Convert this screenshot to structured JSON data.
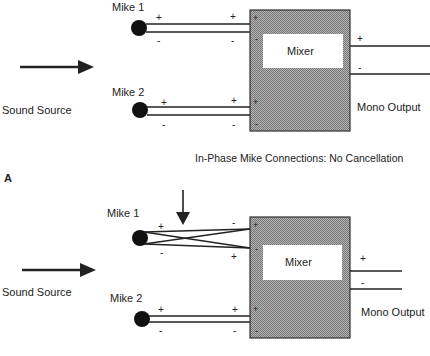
{
  "diagram_a": {
    "panel_label": "A",
    "caption": "In-Phase Mike Connections: No Cancellation",
    "source_label": "Sound Source",
    "mike1": {
      "label": "Mike 1",
      "pos_label": "+",
      "neg_label": "-",
      "wiring": "straight"
    },
    "mike2": {
      "label": "Mike 2",
      "pos_label": "+",
      "neg_label": "-",
      "wiring": "straight"
    },
    "mixer": {
      "label": "Mixer",
      "in1_pos": "+",
      "in1_neg": "-",
      "in2_pos": "+",
      "in2_neg": "-"
    },
    "output": {
      "label": "Mono Output",
      "pos_label": "+",
      "neg_label": "-"
    }
  },
  "diagram_b": {
    "source_label": "Sound Source",
    "mike1": {
      "label": "Mike 1",
      "near_pos_label": "+",
      "near_neg_label": "-",
      "far_top_label": "-",
      "far_bottom_label": "+",
      "wiring": "crossed"
    },
    "mike2": {
      "label": "Mike 2",
      "pos_label": "+",
      "neg_label": "-",
      "wiring": "straight"
    },
    "mixer": {
      "label": "Mixer",
      "in1_pos": "+",
      "in1_neg": "-",
      "in2_pos": "+",
      "in2_neg": "-"
    },
    "output": {
      "label": "Mono Output",
      "pos_label": "+",
      "neg_label": "-"
    }
  },
  "colors": {
    "line": "#222222",
    "mixer_fill": "#9a9a9a",
    "mixer_inner": "#ffffff",
    "mike": "#111111"
  }
}
